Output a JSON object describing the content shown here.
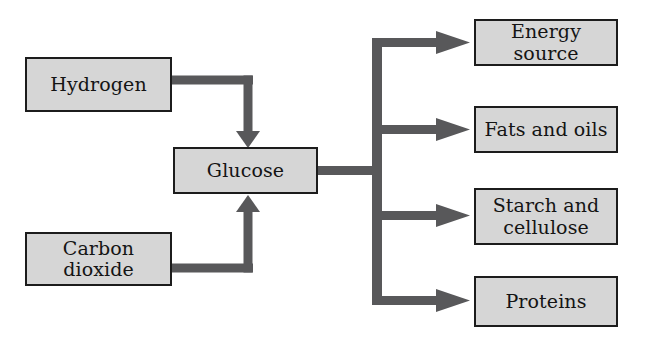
{
  "diagram": {
    "type": "flowchart",
    "title": "",
    "colors": {
      "box_fill": "#d6d6d6",
      "box_border": "#1c1c1c",
      "connector": "#58585a",
      "background": "#ffffff",
      "text": "#141414"
    },
    "inputs": [
      {
        "id": "hydrogen",
        "label": "Hydrogen"
      },
      {
        "id": "carbon-dioxide",
        "label": "Carbon\ndioxide"
      }
    ],
    "intermediate": {
      "id": "glucose",
      "label": "Glucose"
    },
    "outputs": [
      {
        "id": "energy-source",
        "label": "Energy source"
      },
      {
        "id": "fats-and-oils",
        "label": "Fats and oils"
      },
      {
        "id": "starch-and-cellulose",
        "label": "Starch and\ncellulose"
      },
      {
        "id": "proteins",
        "label": "Proteins"
      }
    ],
    "connectors": [
      {
        "id": "hydrogen-to-glucose",
        "from": "hydrogen",
        "to": "glucose",
        "arrow": "down"
      },
      {
        "id": "carbon-dioxide-to-glucose",
        "from": "carbon-dioxide",
        "to": "glucose",
        "arrow": "up"
      },
      {
        "id": "glucose-to-energy-source",
        "from": "glucose",
        "to": "energy-source",
        "arrow": "right"
      },
      {
        "id": "glucose-to-fats-and-oils",
        "from": "glucose",
        "to": "fats-and-oils",
        "arrow": "right"
      },
      {
        "id": "glucose-to-starch-and-cellulose",
        "from": "glucose",
        "to": "starch-and-cellulose",
        "arrow": "right"
      },
      {
        "id": "glucose-to-proteins",
        "from": "glucose",
        "to": "proteins",
        "arrow": "right"
      }
    ]
  }
}
